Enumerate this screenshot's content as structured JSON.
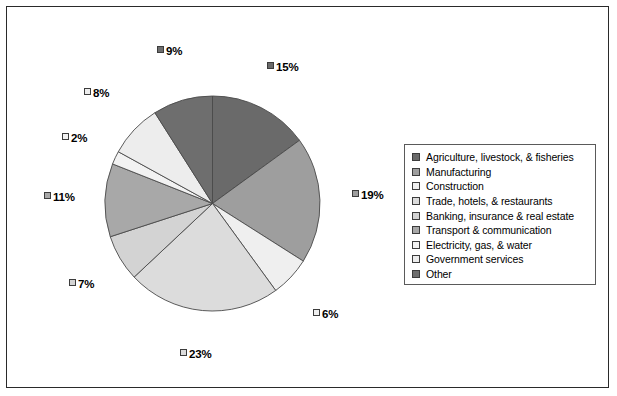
{
  "chart_data": {
    "type": "pie",
    "title": "",
    "legend_position": "right",
    "start_angle_deg": 0,
    "direction": "clockwise",
    "categories": [
      "Agriculture, livestock, & fisheries",
      "Manufacturing",
      "Construction",
      "Trade, hotels, & restaurants",
      "Banking, insurance & real estate",
      "Transport & communication",
      "Electricity, gas, & water",
      "Government services",
      "Other"
    ],
    "values": [
      15,
      19,
      6,
      23,
      7,
      11,
      2,
      8,
      9
    ],
    "value_labels": [
      "15%",
      "19%",
      "6%",
      "23%",
      "7%",
      "11%",
      "2%",
      "8%",
      "9%"
    ],
    "colors": [
      "#6a6a6a",
      "#9e9e9e",
      "#efefef",
      "#dcdcdc",
      "#d3d3d3",
      "#a8a8a8",
      "#f2f2f2",
      "#ededed",
      "#6e6e6e"
    ],
    "slice_border_color": "#4a4a4a",
    "units": "percent"
  },
  "legend": {
    "items": [
      {
        "label": "Agriculture, livestock, & fisheries",
        "color": "#6a6a6a"
      },
      {
        "label": "Manufacturing",
        "color": "#9e9e9e"
      },
      {
        "label": "Construction",
        "color": "#efefef"
      },
      {
        "label": "Trade, hotels, & restaurants",
        "color": "#dcdcdc"
      },
      {
        "label": "Banking, insurance & real estate",
        "color": "#d3d3d3"
      },
      {
        "label": "Transport & communication",
        "color": "#a8a8a8"
      },
      {
        "label": "Electricity, gas, & water",
        "color": "#f2f2f2"
      },
      {
        "label": "Government services",
        "color": "#ededed"
      },
      {
        "label": "Other",
        "color": "#6e6e6e"
      }
    ]
  },
  "labels": [
    {
      "text": "15%",
      "color": "#6a6a6a",
      "x": 267,
      "y": 60
    },
    {
      "text": "19%",
      "color": "#9e9e9e",
      "x": 352,
      "y": 188
    },
    {
      "text": "6%",
      "color": "#efefef",
      "x": 313,
      "y": 307
    },
    {
      "text": "23%",
      "color": "#dcdcdc",
      "x": 180,
      "y": 347
    },
    {
      "text": "7%",
      "color": "#d3d3d3",
      "x": 69,
      "y": 277
    },
    {
      "text": "11%",
      "color": "#a8a8a8",
      "x": 44,
      "y": 190
    },
    {
      "text": "2%",
      "color": "#f2f2f2",
      "x": 62,
      "y": 131
    },
    {
      "text": "8%",
      "color": "#ededed",
      "x": 84,
      "y": 86
    },
    {
      "text": "9%",
      "color": "#6e6e6e",
      "x": 157,
      "y": 44
    }
  ],
  "frame": {
    "border_color": "#2a2a2a",
    "background": "#ffffff"
  }
}
